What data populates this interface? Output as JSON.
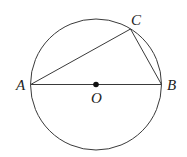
{
  "diagram": {
    "type": "geometry",
    "colors": {
      "line": "#3a3a3a",
      "text": "#222222",
      "background": "#ffffff"
    },
    "circle": {
      "center": "O",
      "cx": 96,
      "cy": 84.5,
      "r": 65.5
    },
    "points": {
      "A": {
        "label": "A",
        "x": 30.7,
        "y": 84.5
      },
      "B": {
        "label": "B",
        "x": 161.5,
        "y": 84.5
      },
      "C": {
        "label": "C",
        "x": 130.5,
        "y": 29
      },
      "O": {
        "label": "O",
        "x": 96,
        "y": 84.5
      }
    },
    "segments": [
      {
        "from": "A",
        "to": "B",
        "name": "diameter-AB"
      },
      {
        "from": "A",
        "to": "C",
        "name": "chord-AC"
      },
      {
        "from": "C",
        "to": "B",
        "name": "chord-CB"
      }
    ]
  }
}
